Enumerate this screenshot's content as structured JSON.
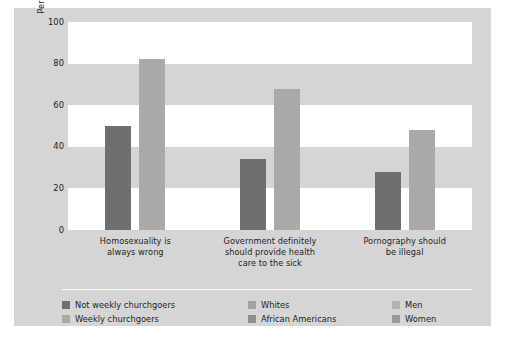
{
  "chart_data": {
    "type": "bar",
    "title": "",
    "subtitle": "",
    "xlabel": "",
    "ylabel": "Percentage Giving Displayed Response",
    "ylim": [
      0,
      100
    ],
    "yticks": [
      0,
      20,
      40,
      60,
      80,
      100
    ],
    "ytick_labels": [
      "0",
      "20",
      "40",
      "60",
      "80",
      "100"
    ],
    "grid": "alternating horizontal bands",
    "legend_position": "bottom",
    "categories": [
      "Homosexuality is always wrong",
      "Government definitely should provide health care to the sick",
      "Pornography should be illegal"
    ],
    "category_lines": [
      [
        "Homosexuality is",
        "always wrong"
      ],
      [
        "Government definitely",
        "should provide health",
        "care to the sick"
      ],
      [
        "Pornography should",
        "be illegal"
      ]
    ],
    "series": [
      {
        "name": "Not weekly churchgoers / Whites / Men",
        "color": "#6f6f6f",
        "values": [
          50,
          34,
          28
        ]
      },
      {
        "name": "Weekly churchgoers / African Americans / Women",
        "color": "#a9a9a9",
        "values": [
          82,
          68,
          48
        ]
      }
    ],
    "bars": [
      {
        "group": 0,
        "series": 0,
        "value": 50,
        "color": "#6f6f6f"
      },
      {
        "group": 0,
        "series": 1,
        "value": 82,
        "color": "#a9a9a9"
      },
      {
        "group": 1,
        "series": 0,
        "value": 34,
        "color": "#6f6f6f"
      },
      {
        "group": 1,
        "series": 1,
        "value": 68,
        "color": "#a9a9a9"
      },
      {
        "group": 2,
        "series": 0,
        "value": 28,
        "color": "#6f6f6f"
      },
      {
        "group": 2,
        "series": 1,
        "value": 48,
        "color": "#a9a9a9"
      }
    ],
    "legend_entries": [
      {
        "label": "Not weekly churchgoers",
        "color": "#6f6f6f",
        "column": 0,
        "row": 0
      },
      {
        "label": "Weekly churchgoers",
        "color": "#a9a9a9",
        "column": 0,
        "row": 1
      },
      {
        "label": "Whites",
        "color": "#a2a2a2",
        "column": 1,
        "row": 0
      },
      {
        "label": "African Americans",
        "color": "#8f8f8f",
        "column": 1,
        "row": 1
      },
      {
        "label": "Men",
        "color": "#b3b3b3",
        "column": 2,
        "row": 0
      },
      {
        "label": "Women",
        "color": "#9a9a9a",
        "column": 2,
        "row": 1
      }
    ],
    "bands": [
      {
        "from": 0,
        "to": 20,
        "fill": "white"
      },
      {
        "from": 20,
        "to": 40,
        "fill": "gray"
      },
      {
        "from": 40,
        "to": 60,
        "fill": "white"
      },
      {
        "from": 60,
        "to": 80,
        "fill": "gray"
      },
      {
        "from": 80,
        "to": 100,
        "fill": "white"
      }
    ],
    "colors": {
      "panel_background": "#d5d5d5",
      "page_background": "#ffffff",
      "band_white": "#ffffff",
      "band_gray": "#d5d5d5",
      "bar_dark": "#6f6f6f",
      "bar_light": "#a9a9a9",
      "text": "#1e1e1e",
      "divider": "#fdfdfd"
    }
  }
}
